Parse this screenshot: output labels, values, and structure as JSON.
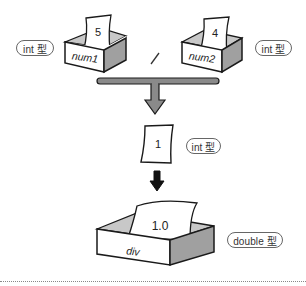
{
  "diagram": {
    "operands": [
      {
        "variable": "num1",
        "value": "5",
        "type_label": "int 型"
      },
      {
        "variable": "num2",
        "value": "4",
        "type_label": "int 型"
      }
    ],
    "operator": "/",
    "intermediate": {
      "value": "1",
      "type_label": "int 型"
    },
    "result": {
      "variable": "div",
      "value": "1.0",
      "type_label": "double 型"
    },
    "colors": {
      "outline": "#1a1a1a",
      "box_side": "#a0a0a0",
      "box_inner": "#c8c8c8",
      "connector": "#8a8a8a",
      "arrow_black": "#111111",
      "badge_border": "#666666"
    }
  }
}
